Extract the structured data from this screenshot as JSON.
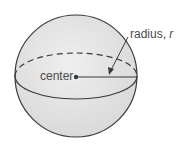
{
  "diagram": {
    "type": "sphere",
    "labels": {
      "center": "center",
      "radius_prefix": "radius, ",
      "radius_var": "r"
    },
    "colors": {
      "fill": "#e3e3e3",
      "stroke": "#3a3a3a",
      "text": "#4a4a4a"
    }
  }
}
